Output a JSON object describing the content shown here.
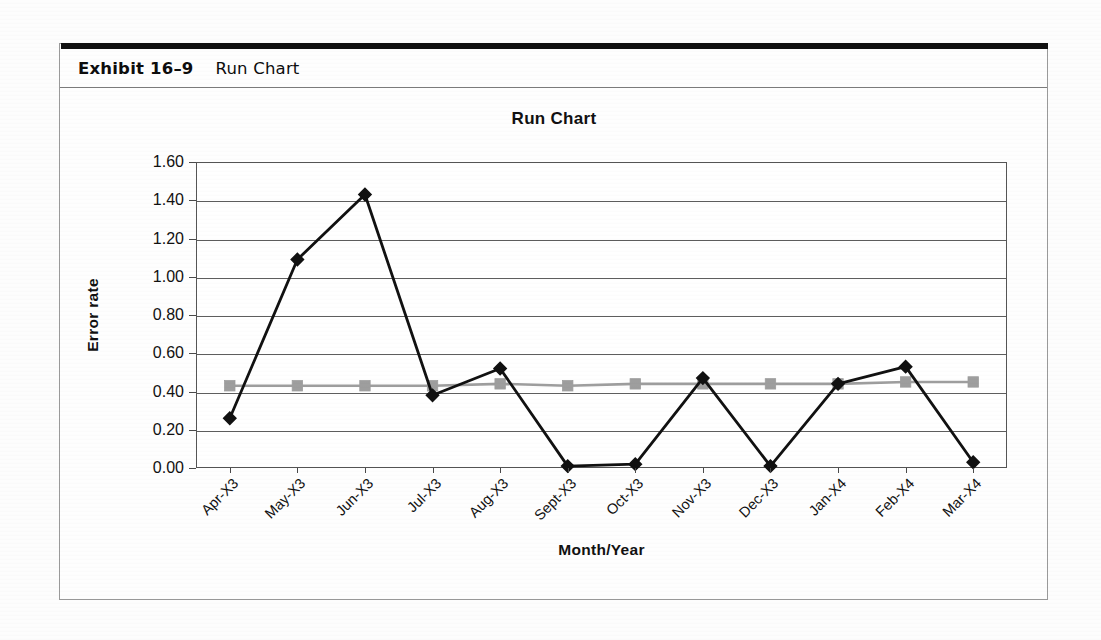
{
  "exhibit": {
    "number": "Exhibit 16–9",
    "caption": "Run Chart"
  },
  "chart_data": {
    "type": "line",
    "title": "Run Chart",
    "xlabel": "Month/Year",
    "ylabel": "Error rate",
    "categories": [
      "Apr-X3",
      "May-X3",
      "Jun-X3",
      "Jul-X3",
      "Aug-X3",
      "Sept-X3",
      "Oct-X3",
      "Nov-X3",
      "Dec-X3",
      "Jan-X4",
      "Feb-X4",
      "Mar-X4"
    ],
    "ylim": [
      0.0,
      1.6
    ],
    "yticks": [
      "0.00",
      "0.20",
      "0.40",
      "0.60",
      "0.80",
      "1.00",
      "1.20",
      "1.40",
      "1.60"
    ],
    "ytick_values": [
      0.0,
      0.2,
      0.4,
      0.6,
      0.8,
      1.0,
      1.2,
      1.4,
      1.6
    ],
    "grid": true,
    "legend": "none",
    "series": [
      {
        "name": "Error rate",
        "marker": "diamond",
        "color": "#111111",
        "values": [
          0.26,
          1.09,
          1.43,
          0.38,
          0.52,
          0.01,
          0.02,
          0.47,
          0.01,
          0.44,
          0.53,
          0.03
        ]
      },
      {
        "name": "Center line",
        "marker": "square",
        "color": "#9e9e9e",
        "values": [
          0.43,
          0.43,
          0.43,
          0.43,
          0.44,
          0.43,
          0.44,
          0.44,
          0.44,
          0.44,
          0.45,
          0.45
        ]
      }
    ]
  }
}
